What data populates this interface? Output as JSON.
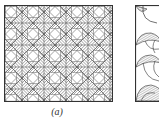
{
  "figure": {
    "panels": [
      {
        "id": "a",
        "caption": "(a)",
        "description": "Square tiling with diagonal basket-weave hatched pattern and white diamonds",
        "pattern": "basket-weave-diagonal",
        "period_px": 22
      },
      {
        "id": "b",
        "caption": "",
        "description": "Partially visible panel with hatched crescent/fan shapes along left edge",
        "pattern": "crescent-fans"
      }
    ],
    "colors": {
      "stroke": "#333333",
      "hatch": "#555555",
      "background": "#ffffff"
    }
  }
}
